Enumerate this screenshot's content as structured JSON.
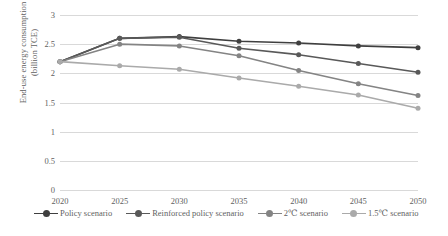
{
  "chart_data": {
    "type": "line",
    "title": "",
    "xlabel": "",
    "ylabel": "End-use energy consumption (billion TCE)",
    "ylabel_line1": "End-use energy consumption",
    "ylabel_line2": "(billion TCE)",
    "categories": [
      "2020",
      "2025",
      "2030",
      "2035",
      "2040",
      "2045",
      "2050"
    ],
    "x": [
      2020,
      2025,
      2030,
      2035,
      2040,
      2045,
      2050
    ],
    "ylim": [
      0,
      3
    ],
    "yticks": [
      "0",
      "0.5",
      "1",
      "1.5",
      "2",
      "2.5",
      "3"
    ],
    "ytick_values": [
      0,
      0.5,
      1,
      1.5,
      2,
      2.5,
      3
    ],
    "grid": true,
    "legend_position": "bottom",
    "series": [
      {
        "name": "Policy scenario",
        "color": "#3f3f3f",
        "values": [
          2.2,
          2.6,
          2.63,
          2.55,
          2.52,
          2.47,
          2.44
        ]
      },
      {
        "name": "Reinforced policy scenario",
        "color": "#595959",
        "values": [
          2.2,
          2.6,
          2.62,
          2.43,
          2.32,
          2.17,
          2.02
        ]
      },
      {
        "name": "2℃ scenario",
        "color": "#848484",
        "values": [
          2.2,
          2.5,
          2.47,
          2.3,
          2.05,
          1.82,
          1.62
        ]
      },
      {
        "name": "1.5℃ scenario",
        "color": "#aaaaaa",
        "values": [
          2.2,
          2.13,
          2.07,
          1.92,
          1.78,
          1.63,
          1.4
        ]
      }
    ]
  }
}
